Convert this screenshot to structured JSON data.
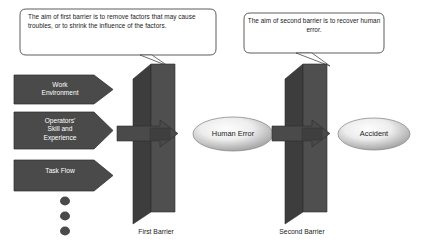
{
  "diagram": {
    "background_color": "#ffffff",
    "callouts": [
      {
        "id": "first-barrier-callout",
        "text": "The aim of first barrier is to remove factors that may cause troubles, or to shrink the influence of the factors."
      },
      {
        "id": "second-barrier-callout",
        "text": "The aim of second barrier is to recover human error."
      }
    ],
    "factors": [
      {
        "id": "work-environment",
        "label": "Work\nEnvironment"
      },
      {
        "id": "operators-skill-and-experience",
        "label": "Operators'\nSkill and\nExperience"
      },
      {
        "id": "task-flow",
        "label": "Task Flow"
      }
    ],
    "ellipsis_dots": 3,
    "barriers": [
      {
        "id": "first-barrier",
        "caption": "First Barrier"
      },
      {
        "id": "second-barrier",
        "caption": "Second Barrier"
      }
    ],
    "outcomes": [
      {
        "id": "human-error",
        "label": "Human Error"
      },
      {
        "id": "accident",
        "label": "Accident"
      }
    ],
    "colors": {
      "shape_dark": "#4a4a4a",
      "shape_side": "#3d3d3d",
      "outline": "#2b2b2b",
      "callout_fill": "#ffffff",
      "callout_stroke": "#4a4a4a",
      "ellipse_center": "#fbfbfb",
      "ellipse_edge": "#9c9c9c",
      "text_dark": "#1a1a1a",
      "text_light": "#ffffff"
    }
  }
}
